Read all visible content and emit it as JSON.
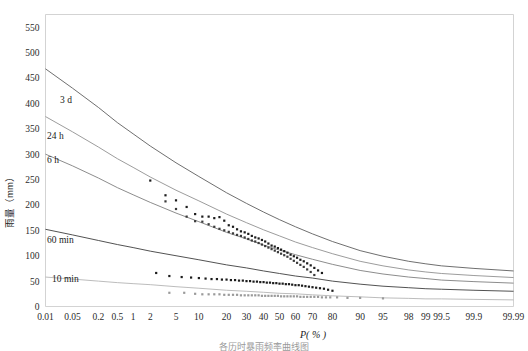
{
  "figure": {
    "caption": "各历时暴雨频率曲线图",
    "axis_x_title": "P( % )",
    "axis_y_title": "雨量（mm）"
  },
  "chart_data": {
    "type": "line",
    "title": "",
    "subtitle": "",
    "xlabel": "P( % )",
    "ylabel": "雨量（mm）",
    "x_scale": "probability",
    "grid": false,
    "legend_position": "inline-left",
    "ylim": [
      0,
      575
    ],
    "yticks": [
      0,
      50,
      100,
      150,
      200,
      250,
      300,
      350,
      400,
      450,
      500,
      550
    ],
    "ytick_labels": [
      "0",
      "50",
      "100",
      "150",
      "200",
      "250",
      "300",
      "350",
      "400",
      "450",
      "500",
      "550"
    ],
    "xticks": [
      0.01,
      0.05,
      0.2,
      0.5,
      1,
      2,
      5,
      10,
      20,
      30,
      40,
      50,
      60,
      70,
      80,
      90,
      95,
      98,
      99,
      99.5,
      99.9,
      99.99
    ],
    "xtick_labels": [
      "0.01",
      "0.05",
      "0.2",
      "0.5",
      "1",
      "2",
      "5",
      "10",
      "20",
      "30",
      "40",
      "50",
      "60",
      "70",
      "80",
      "90",
      "95",
      "98",
      "99",
      "99.5",
      "99.9",
      "99.99"
    ],
    "series": [
      {
        "name": "3 d",
        "label": "3 d",
        "color": "#555555",
        "marker": "square",
        "marker_color": "#1c1c1c",
        "fit_x": [
          0.01,
          0.05,
          0.2,
          0.5,
          1,
          2,
          5,
          10,
          20,
          30,
          40,
          50,
          60,
          70,
          80,
          90,
          95,
          98,
          99,
          99.5,
          99.9,
          99.99
        ],
        "fit_y": [
          468,
          430,
          392,
          362,
          340,
          316,
          283,
          256,
          224,
          203,
          186,
          171,
          157,
          143,
          128,
          110,
          99,
          89,
          84,
          80,
          75,
          70
        ],
        "points_x": [
          2,
          3.5,
          5,
          7,
          9,
          11,
          13,
          15,
          17,
          19,
          21,
          23,
          25,
          27,
          29,
          31,
          33,
          35,
          37,
          39,
          41,
          43,
          45,
          47,
          49,
          51,
          53,
          55,
          57,
          59,
          61,
          63,
          65,
          67,
          69,
          71,
          73,
          75
        ],
        "points_y": [
          248,
          219,
          209,
          196,
          182,
          177,
          177,
          174,
          176,
          169,
          160,
          157,
          152,
          148,
          146,
          143,
          139,
          136,
          134,
          131,
          128,
          124,
          120,
          118,
          115,
          112,
          109,
          106,
          102,
          99,
          96,
          92,
          89,
          85,
          81,
          76,
          71,
          66
        ]
      },
      {
        "name": "24 h",
        "label": "24 h",
        "color": "#8a8a8a",
        "marker": "square",
        "marker_color": "#3a3a3a",
        "fit_x": [
          0.01,
          0.05,
          0.2,
          0.5,
          1,
          2,
          5,
          10,
          20,
          30,
          40,
          50,
          60,
          70,
          80,
          90,
          95,
          98,
          99,
          99.5,
          99.9,
          99.99
        ],
        "fit_y": [
          374,
          344,
          314,
          291,
          274,
          255,
          229,
          208,
          182,
          165,
          151,
          139,
          127,
          116,
          104,
          89,
          80,
          72,
          68,
          65,
          61,
          57
        ],
        "points_x": [
          3.5,
          5,
          7,
          9,
          11,
          13,
          15,
          17,
          19,
          21,
          23,
          25,
          27,
          29,
          31,
          33,
          35,
          37,
          39,
          41,
          43,
          45,
          47,
          49,
          51,
          53,
          55,
          57,
          59,
          61,
          63,
          65,
          67,
          69,
          71
        ],
        "points_y": [
          207,
          192,
          177,
          168,
          167,
          162,
          157,
          153,
          150,
          147,
          144,
          141,
          139,
          136,
          133,
          130,
          128,
          125,
          122,
          119,
          116,
          113,
          110,
          107,
          104,
          101,
          98,
          94,
          90,
          86,
          82,
          78,
          73,
          68,
          62
        ]
      },
      {
        "name": "6 h",
        "label": "6 h",
        "color": "#777777",
        "marker": "square",
        "marker_color": "#2a2a2a",
        "fit_x": [
          0.01,
          0.05,
          0.2,
          0.5,
          1,
          2,
          5,
          10,
          20,
          30,
          40,
          50,
          60,
          70,
          80,
          90,
          95,
          98,
          99,
          99.5,
          99.9,
          99.99
        ],
        "fit_y": [
          300,
          277,
          253,
          234,
          220,
          205,
          184,
          167,
          146,
          133,
          121,
          111,
          102,
          93,
          83,
          71,
          64,
          58,
          55,
          52,
          49,
          46
        ],
        "points_x": [],
        "points_y": []
      },
      {
        "name": "60 min",
        "label": "60 min",
        "color": "#333333",
        "marker": "square",
        "marker_color": "#1c1c1c",
        "fit_x": [
          0.01,
          0.05,
          0.2,
          0.5,
          1,
          2,
          5,
          10,
          20,
          30,
          40,
          50,
          60,
          70,
          80,
          90,
          95,
          98,
          99,
          99.5,
          99.9,
          99.99
        ],
        "fit_y": [
          152,
          141,
          130,
          122,
          116,
          109,
          100,
          92,
          82,
          76,
          70,
          65,
          60,
          56,
          50,
          44,
          40,
          37,
          35,
          34,
          32,
          30
        ],
        "points_x": [
          2.5,
          4,
          6,
          8,
          10,
          12,
          14,
          16,
          18,
          20,
          22,
          24,
          26,
          28,
          30,
          32,
          34,
          36,
          38,
          40,
          42,
          44,
          46,
          48,
          50,
          52,
          54,
          56,
          58,
          60,
          62,
          64,
          66,
          68,
          70,
          72,
          74,
          76,
          78,
          80
        ],
        "points_y": [
          66,
          60,
          58,
          57,
          56,
          55,
          54,
          54,
          53,
          53,
          52,
          52,
          51,
          51,
          50,
          50,
          49,
          49,
          48,
          48,
          47,
          47,
          46,
          46,
          45,
          45,
          44,
          44,
          43,
          42,
          42,
          41,
          40,
          39,
          38,
          37,
          36,
          35,
          33,
          31
        ]
      },
      {
        "name": "10 min",
        "label": "10 min",
        "color": "#b0b0b0",
        "marker": "square",
        "marker_color": "#9a9a9a",
        "fit_x": [
          0.01,
          0.05,
          0.2,
          0.5,
          1,
          2,
          5,
          10,
          20,
          30,
          40,
          50,
          60,
          70,
          80,
          90,
          95,
          98,
          99,
          99.5,
          99.9,
          99.99
        ],
        "fit_y": [
          58,
          54,
          50,
          47,
          45,
          43,
          39,
          36,
          32,
          30,
          28,
          26,
          25,
          23,
          21,
          19,
          17,
          16,
          15,
          15,
          14,
          13
        ],
        "points_x": [
          4,
          6.5,
          9,
          11,
          13,
          15,
          17,
          19,
          21,
          23,
          25,
          27,
          29,
          31,
          33,
          35,
          37,
          39,
          41,
          43,
          45,
          47,
          49,
          51,
          53,
          55,
          57,
          59,
          61,
          63,
          65,
          67,
          69,
          71,
          73,
          75,
          77,
          79,
          82,
          86,
          90,
          95
        ],
        "points_y": [
          27,
          27,
          25,
          24,
          24,
          24,
          24,
          23,
          23,
          23,
          23,
          22,
          22,
          22,
          22,
          22,
          22,
          21,
          21,
          21,
          21,
          21,
          21,
          20,
          20,
          20,
          20,
          20,
          20,
          19,
          19,
          19,
          19,
          19,
          19,
          18,
          18,
          18,
          18,
          17,
          17,
          16
        ]
      }
    ],
    "series_inline_labels": [
      {
        "text": "3 d",
        "x_px": 60,
        "y_px": 103
      },
      {
        "text": "24 h",
        "x_px": 47,
        "y_px": 139
      },
      {
        "text": "6 h",
        "x_px": 47,
        "y_px": 163
      },
      {
        "text": "60 min",
        "x_px": 47,
        "y_px": 243
      },
      {
        "text": "10 min",
        "x_px": 52,
        "y_px": 282
      }
    ]
  }
}
